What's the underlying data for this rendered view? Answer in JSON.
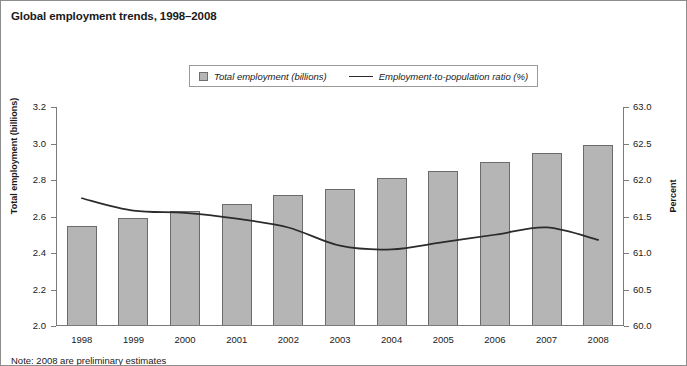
{
  "chart_data": {
    "type": "bar",
    "title": "Global employment trends, 1998–2008",
    "xlabel": "",
    "ylabel": "Total employment (billions)",
    "y2label": "Percent",
    "categories": [
      "1998",
      "1999",
      "2000",
      "2001",
      "2002",
      "2003",
      "2004",
      "2005",
      "2006",
      "2007",
      "2008"
    ],
    "ylim": [
      2.0,
      3.2
    ],
    "y2lim": [
      60.0,
      63.0
    ],
    "yticks": [
      "2.0",
      "2.2",
      "2.4",
      "2.6",
      "2.8",
      "3.0",
      "3.2"
    ],
    "y2ticks": [
      "60.0",
      "60.5",
      "61.0",
      "61.5",
      "62.0",
      "62.5",
      "63.0"
    ],
    "grid": false,
    "legend_position": "top-center",
    "series": [
      {
        "name": "Total employment (billions)",
        "legend_label": "Total employment (billions)",
        "type": "bar",
        "axis": "left",
        "color": "#b5b5b5",
        "edge_color": "#6b6b6b",
        "values": [
          2.55,
          2.59,
          2.63,
          2.67,
          2.72,
          2.75,
          2.81,
          2.85,
          2.9,
          2.95,
          2.99
        ]
      },
      {
        "name": "Employment-to-population ratio (%)",
        "legend_label": "Employment-to-population ratio (%)",
        "type": "line",
        "axis": "right",
        "color": "#2b2b2b",
        "values": [
          61.75,
          61.58,
          61.55,
          61.47,
          61.35,
          61.1,
          61.05,
          61.15,
          61.25,
          61.35,
          61.18
        ]
      }
    ],
    "note": "Note: 2008 are preliminary estimates"
  },
  "legend": {
    "bar_label": "Total employment (billions)",
    "line_label": "Employment-to-population ratio (%)"
  }
}
